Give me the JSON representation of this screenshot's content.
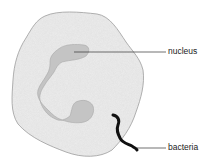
{
  "diagram": {
    "labels": {
      "nucleus": "nucleus",
      "bacteria": "bacteria"
    },
    "colors": {
      "cell_fill": "#ededed",
      "cell_outline": "#9a9a9a",
      "nucleus_fill": "#c4c4c4",
      "bacteria": "#111111",
      "leader_line": "#333333"
    }
  }
}
